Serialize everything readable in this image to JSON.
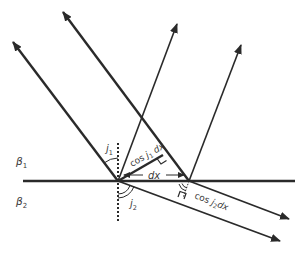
{
  "diagram": {
    "media": [
      {
        "id": "upper",
        "label": "β",
        "subscript": "1"
      },
      {
        "id": "lower",
        "label": "β",
        "subscript": "2"
      }
    ],
    "angles": {
      "incidence": {
        "label": "j",
        "subscript": "1"
      },
      "refraction": {
        "label": "j",
        "subscript": "2"
      }
    },
    "segment_labels": {
      "dx": "dx",
      "incident_path": {
        "prefix": "cos ",
        "var": "j",
        "subscript": "1",
        "suffix": " dx"
      },
      "refracted_path": {
        "prefix": "cos ",
        "var": "j",
        "subscript": "2",
        "suffix": "dx"
      }
    },
    "colors": {
      "line": "#2a2a2a",
      "text": "#3a3a3a",
      "background": "#ffffff"
    },
    "points": {
      "left_incidence": [
        118,
        181
      ],
      "right_incidence": [
        189,
        181
      ]
    }
  }
}
